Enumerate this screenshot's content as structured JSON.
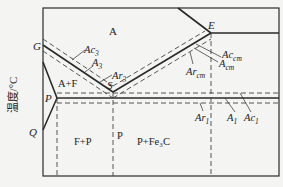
{
  "diagram": {
    "y_axis_label": "温度/°C",
    "points": {
      "G": "G",
      "S": "S",
      "E": "E",
      "P": "P",
      "Q": "Q"
    },
    "regions": {
      "austenite": "A",
      "austenite_ferrite": "A+F",
      "ferrite_pearlite": "F+P",
      "pearlite": "P",
      "pearlite_cementite": "P+Fe₃C"
    },
    "lines": {
      "Ac3": {
        "base": "Ac",
        "sub": "3"
      },
      "A3": {
        "base": "A",
        "sub": "3"
      },
      "Ar3": {
        "base": "Ar",
        "sub": "3"
      },
      "Accm": {
        "base": "Ac",
        "sub": "cm"
      },
      "Acm": {
        "base": "A",
        "sub": "cm"
      },
      "Arcm": {
        "base": "Ar",
        "sub": "cm"
      },
      "Ar1": {
        "base": "Ar",
        "sub": "1"
      },
      "A1": {
        "base": "A",
        "sub": "1"
      },
      "Ac1": {
        "base": "Ac",
        "sub": "1"
      }
    },
    "colors": {
      "line": "#2a2a2a",
      "background": "#f4f4f2"
    }
  }
}
